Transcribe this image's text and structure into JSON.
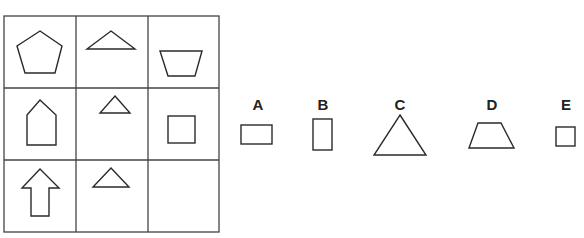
{
  "puzzle": {
    "header_fragment": "",
    "grid": {
      "rows": 3,
      "cols": 3,
      "cells": [
        {
          "row": 0,
          "col": 0,
          "shape": "pentagon"
        },
        {
          "row": 0,
          "col": 1,
          "shape": "wide-triangle"
        },
        {
          "row": 0,
          "col": 2,
          "shape": "inverted-trapezoid"
        },
        {
          "row": 1,
          "col": 0,
          "shape": "house-pentagon"
        },
        {
          "row": 1,
          "col": 1,
          "shape": "small-triangle"
        },
        {
          "row": 1,
          "col": 2,
          "shape": "square"
        },
        {
          "row": 2,
          "col": 0,
          "shape": "up-arrow"
        },
        {
          "row": 2,
          "col": 1,
          "shape": "triangle"
        },
        {
          "row": 2,
          "col": 2,
          "shape": "empty"
        }
      ]
    },
    "options": [
      {
        "label": "A",
        "shape": "horizontal-rectangle"
      },
      {
        "label": "B",
        "shape": "vertical-rectangle"
      },
      {
        "label": "C",
        "shape": "large-triangle"
      },
      {
        "label": "D",
        "shape": "trapezoid"
      },
      {
        "label": "E",
        "shape": "small-square"
      }
    ],
    "colors": {
      "stroke": "#2a2a2a",
      "grid": "#444444",
      "background": "#ffffff"
    }
  }
}
